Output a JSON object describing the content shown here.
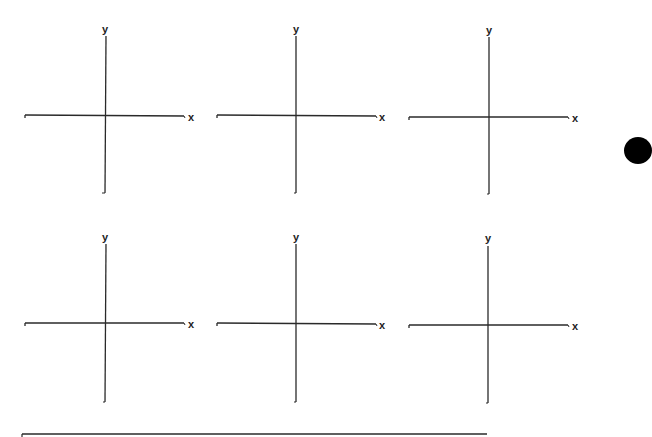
{
  "worksheet": {
    "graphs": [
      {
        "id": 1,
        "x_label": "x",
        "y_label": "y"
      },
      {
        "id": 2,
        "x_label": "x",
        "y_label": "y"
      },
      {
        "id": 3,
        "x_label": "x",
        "y_label": "y"
      },
      {
        "id": 4,
        "x_label": "x",
        "y_label": "y"
      },
      {
        "id": 5,
        "x_label": "x",
        "y_label": "y"
      },
      {
        "id": 6,
        "x_label": "x",
        "y_label": "y"
      }
    ],
    "colors": {
      "axis": "#2a2a2a",
      "background": "#ffffff",
      "marker": "#000000"
    }
  }
}
